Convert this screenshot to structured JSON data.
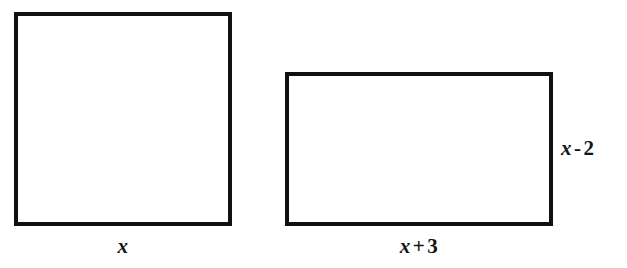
{
  "figure": {
    "type": "geometry-diagram",
    "background_color": "#ffffff",
    "stroke_color": "#111111",
    "label_color": "#141414"
  },
  "shapes": [
    {
      "name": "square",
      "kind": "square",
      "x": 14,
      "y": 12,
      "width": 218,
      "height": 214,
      "stroke_width": 4
    },
    {
      "name": "rectangle",
      "kind": "rectangle",
      "x": 285,
      "y": 72,
      "width": 268,
      "height": 154,
      "stroke_width": 4
    }
  ],
  "labels": {
    "square_width": {
      "text": "x",
      "variable": "x",
      "position": "below",
      "shape": "square"
    },
    "rectangle_width": {
      "text": "x + 3",
      "variable": "x",
      "operator": "+",
      "constant": "3",
      "position": "below",
      "shape": "rectangle"
    },
    "rectangle_height": {
      "text": "x - 2",
      "variable": "x",
      "operator": "-",
      "constant": "2",
      "position": "right",
      "shape": "rectangle"
    }
  }
}
